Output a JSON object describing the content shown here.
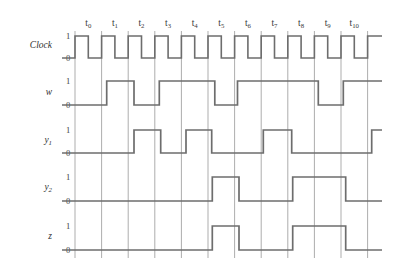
{
  "figure": {
    "kind": "digital-timing-diagram",
    "background_color": "#ffffff",
    "wave_color": "#6d6d6d",
    "grid_color": "#8a8a8a",
    "text_color": "#2f2f2f"
  },
  "time_axis": {
    "labels": [
      "t0",
      "t1",
      "t2",
      "t3",
      "t4",
      "t5",
      "t6",
      "t7",
      "t8",
      "t9",
      "t10"
    ],
    "label_base": [
      "t",
      "t",
      "t",
      "t",
      "t",
      "t",
      "t",
      "t",
      "t",
      "t",
      "t"
    ],
    "label_subscripts": [
      "0",
      "1",
      "2",
      "3",
      "4",
      "5",
      "6",
      "7",
      "8",
      "9",
      "10"
    ],
    "first_gridline_x": 75,
    "interval_width": 26.6,
    "interval_count": 11,
    "label_y": 26
  },
  "levels": {
    "high_label": "1",
    "low_label": "0"
  },
  "rows": [
    {
      "name": "Clock",
      "name_base": "Clock",
      "name_subscript": "",
      "y_high": 36,
      "y_low": 58,
      "label_y": 48,
      "type": "clock",
      "start_level": 0,
      "lead_in": true,
      "transitions": []
    },
    {
      "name": "w",
      "name_base": "w",
      "name_subscript": "",
      "y_high": 81,
      "y_low": 105,
      "label_y": 95,
      "type": "signal",
      "start_level": 0,
      "lead_in": true,
      "transitions": [
        {
          "x": 106.7,
          "level": 1
        },
        {
          "x": 134.0,
          "level": 0
        },
        {
          "x": 159.3,
          "level": 1
        },
        {
          "x": 214.8,
          "level": 0
        },
        {
          "x": 237.5,
          "level": 1
        },
        {
          "x": 318.3,
          "level": 0
        },
        {
          "x": 343.3,
          "level": 1
        }
      ]
    },
    {
      "name": "y1",
      "name_base": "y",
      "name_subscript": "1",
      "y_high": 130,
      "y_low": 153,
      "label_y": 143,
      "type": "signal",
      "start_level": 0,
      "lead_in": true,
      "transitions": [
        {
          "x": 134.0,
          "level": 1
        },
        {
          "x": 160.7,
          "level": 0
        },
        {
          "x": 186.0,
          "level": 1
        },
        {
          "x": 211.7,
          "level": 0
        },
        {
          "x": 263.3,
          "level": 1
        },
        {
          "x": 291.7,
          "level": 0
        },
        {
          "x": 371.7,
          "level": 1
        }
      ]
    },
    {
      "name": "y2",
      "name_base": "y",
      "name_subscript": "2",
      "y_high": 177,
      "y_low": 201,
      "label_y": 190,
      "type": "signal",
      "start_level": 0,
      "lead_in": true,
      "transitions": [
        {
          "x": 212.3,
          "level": 1
        },
        {
          "x": 239.0,
          "level": 0
        },
        {
          "x": 292.7,
          "level": 1
        },
        {
          "x": 345.7,
          "level": 0
        }
      ]
    },
    {
      "name": "z",
      "name_base": "z",
      "name_subscript": "",
      "y_high": 226,
      "y_low": 250,
      "label_y": 239,
      "type": "signal",
      "start_level": 0,
      "lead_in": true,
      "transitions": [
        {
          "x": 212.3,
          "level": 1
        },
        {
          "x": 239.0,
          "level": 0
        },
        {
          "x": 292.7,
          "level": 1
        },
        {
          "x": 345.7,
          "level": 0
        }
      ]
    }
  ],
  "geometry": {
    "wave_start_x": 62,
    "wave_end_x": 382,
    "grid_top_y": 31,
    "grid_bottom_y": 258,
    "name_x": 52,
    "level_label_x": 68
  },
  "chart_data": {
    "type": "timing",
    "title": "",
    "xlabel": "",
    "ylabel": "",
    "time_slots": [
      "t0",
      "t1",
      "t2",
      "t3",
      "t4",
      "t5",
      "t6",
      "t7",
      "t8",
      "t9",
      "t10"
    ],
    "series": [
      {
        "name": "Clock",
        "values": [
          1,
          1,
          1,
          1,
          1,
          1,
          1,
          1,
          1,
          1,
          1
        ]
      },
      {
        "name": "w",
        "values": [
          0,
          1,
          0,
          1,
          1,
          0,
          1,
          1,
          1,
          0,
          1
        ]
      },
      {
        "name": "y1",
        "values": [
          0,
          0,
          1,
          0,
          1,
          0,
          0,
          1,
          0,
          0,
          0
        ]
      },
      {
        "name": "y2",
        "values": [
          0,
          0,
          0,
          0,
          0,
          1,
          0,
          0,
          1,
          1,
          0
        ]
      },
      {
        "name": "z",
        "values": [
          0,
          0,
          0,
          0,
          0,
          1,
          0,
          0,
          1,
          1,
          0
        ]
      }
    ]
  }
}
